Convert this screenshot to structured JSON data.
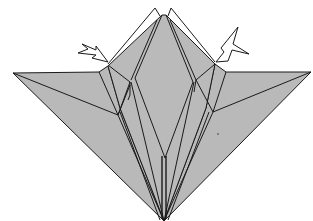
{
  "diagram": {
    "type": "origami-instruction-step",
    "colors": {
      "paper": "#b8b8b8",
      "line": "#1a1a1a",
      "background": "#ffffff",
      "arrow_fill": "#ffffff"
    },
    "arrows": [
      {
        "name": "left-fold-arrow",
        "direction": "down-right",
        "target": "left-shoulder"
      },
      {
        "name": "right-fold-arrow",
        "direction": "down-left",
        "target": "right-shoulder"
      }
    ]
  }
}
